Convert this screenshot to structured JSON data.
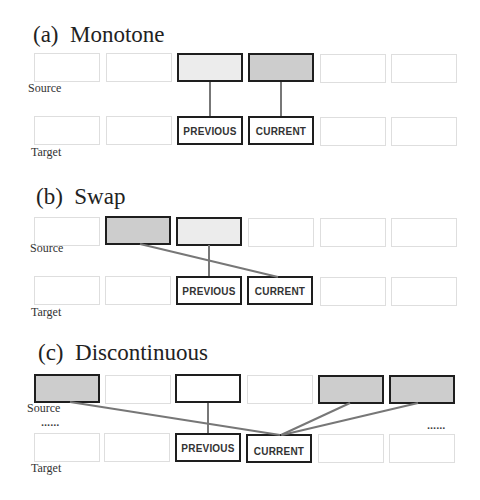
{
  "panels": [
    {
      "id": "a",
      "title": "(a)  Monotone",
      "source_label": "Source",
      "target_label": "Target",
      "source_boxes": [
        "empty",
        "empty",
        "light",
        "dark",
        "empty",
        "empty"
      ],
      "target_boxes": [
        "",
        "",
        "PREVIOUS",
        "CURRENT",
        "",
        ""
      ],
      "links": [
        {
          "from_source": 2,
          "to_target": 2
        },
        {
          "from_source": 3,
          "to_target": 3
        }
      ]
    },
    {
      "id": "b",
      "title": "(b)  Swap",
      "source_label": "Source",
      "target_label": "Target",
      "source_boxes": [
        "empty",
        "dark",
        "light",
        "empty",
        "empty",
        "empty"
      ],
      "target_boxes": [
        "",
        "",
        "PREVIOUS",
        "CURRENT",
        "",
        ""
      ],
      "links": [
        {
          "from_source": 2,
          "to_target": 2
        },
        {
          "from_source": 1,
          "to_target": 3
        }
      ]
    },
    {
      "id": "c",
      "title": "(c)  Discontinuous",
      "source_label": "Source",
      "target_label": "Target",
      "ellipsis_left": "......",
      "ellipsis_right": "......",
      "source_boxes": [
        "dark",
        "empty",
        "white",
        "empty",
        "dark",
        "dark"
      ],
      "target_boxes": [
        "",
        "",
        "PREVIOUS",
        "CURRENT",
        "",
        ""
      ],
      "links": [
        {
          "from_source": 2,
          "to_target": 2
        },
        {
          "from_source": 0,
          "to_target": 3
        },
        {
          "from_source": 4,
          "to_target": 3
        },
        {
          "from_source": 5,
          "to_target": 3
        }
      ]
    }
  ],
  "colors": {
    "active_border": "#1e1e1e",
    "empty_border": "#dedede",
    "light_fill": "#ececec",
    "dark_fill": "#cdcdcd",
    "link": "#777777"
  }
}
